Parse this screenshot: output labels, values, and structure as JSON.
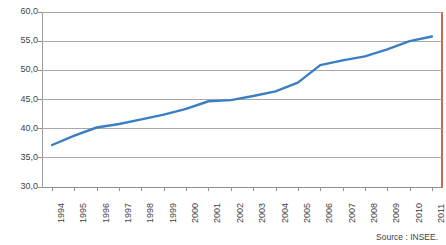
{
  "chart_data": {
    "type": "line",
    "title": "",
    "subtitle": "",
    "xlabel": "",
    "ylabel": "",
    "categories": [
      "1994",
      "1995",
      "1996",
      "1997",
      "1998",
      "1999",
      "2000",
      "2001",
      "2002",
      "2003",
      "2004",
      "2005",
      "2006",
      "2007",
      "2008",
      "2009",
      "2010",
      "2011"
    ],
    "values": [
      37.2,
      38.8,
      40.2,
      40.8,
      41.6,
      42.4,
      43.4,
      44.7,
      44.9,
      45.6,
      46.4,
      47.9,
      50.9,
      51.7,
      52.4,
      53.6,
      55.0,
      55.8
    ],
    "series": [
      {
        "name": "series-1",
        "values": [
          37.2,
          38.8,
          40.2,
          40.8,
          41.6,
          42.4,
          43.4,
          44.7,
          44.9,
          45.6,
          46.4,
          47.9,
          50.9,
          51.7,
          52.4,
          53.6,
          55.0,
          55.8
        ]
      }
    ],
    "ylim": [
      30.0,
      60.0
    ],
    "yticks": [
      30.0,
      35.0,
      40.0,
      45.0,
      50.0,
      55.0,
      60.0
    ],
    "ytick_labels": [
      "30,0",
      "35,0",
      "40,0",
      "45,0",
      "50,0",
      "55,0",
      "60,0"
    ],
    "xtick_labels": [
      "1994",
      "1995",
      "1996",
      "1997",
      "1998",
      "1999",
      "2000",
      "2001",
      "2002",
      "2003",
      "2004",
      "2005",
      "2006",
      "2007",
      "2008",
      "2009",
      "2010",
      "2011"
    ],
    "grid": true,
    "grid_axis": "y",
    "legend": false,
    "legend_position": "none",
    "line_color": "#3a7fc4",
    "grid_color": "#a8a8a8",
    "axis_color": "#8f8f8f",
    "accent_color": "#c96a4f",
    "text_color": "#3f3f3f"
  },
  "footer": {
    "source": "Source : INSEE."
  }
}
